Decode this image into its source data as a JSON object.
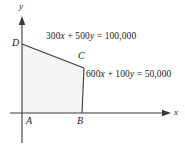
{
  "figure": {
    "kind": "linear-programming-feasible-region",
    "background_color": "#ffffff",
    "line_color": "#3a3a3a",
    "region_fill_color": "#f4f4f4",
    "axes": {
      "x_label": "x",
      "y_label": "y",
      "x_axis_y_px": 113,
      "y_axis_x_px": 22,
      "x_axis_end_px": 168,
      "y_axis_top_px": 18
    },
    "vertices": [
      {
        "name": "A",
        "label": "A",
        "x_px": 22,
        "y_px": 113
      },
      {
        "name": "B",
        "label": "B",
        "x_px": 82,
        "y_px": 113
      },
      {
        "name": "C",
        "label": "C",
        "x_px": 84,
        "y_px": 68
      },
      {
        "name": "D",
        "label": "D",
        "x_px": 22,
        "y_px": 44
      }
    ],
    "constraint_labels": [
      {
        "id": "eq1",
        "coefficient_x": "300",
        "var_x": "x",
        "operator_plus": "+",
        "coefficient_y": "500",
        "var_y": "y",
        "equals": "=",
        "constant": "100,000",
        "full_text": "300x + 500y = 100,000"
      },
      {
        "id": "eq2",
        "coefficient_x": "600",
        "var_x": "x",
        "operator_plus": "+",
        "coefficient_y": "100",
        "var_y": "y",
        "equals": "=",
        "constant": "50,000",
        "full_text": "600x + 100y = 50,000"
      }
    ]
  }
}
